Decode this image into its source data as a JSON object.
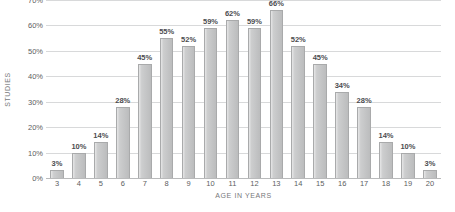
{
  "chart_data": {
    "type": "bar",
    "title": "",
    "xlabel": "AGE IN YEARS",
    "ylabel": "STUDIES",
    "categories": [
      "3",
      "4",
      "5",
      "6",
      "7",
      "8",
      "9",
      "10",
      "11",
      "12",
      "13",
      "14",
      "15",
      "16",
      "17",
      "18",
      "19",
      "20"
    ],
    "values": [
      3,
      10,
      14,
      28,
      45,
      55,
      52,
      59,
      62,
      59,
      66,
      52,
      45,
      34,
      28,
      14,
      10,
      3
    ],
    "value_labels": [
      "3%",
      "10%",
      "14%",
      "28%",
      "45%",
      "55%",
      "52%",
      "59%",
      "62%",
      "59%",
      "66%",
      "52%",
      "45%",
      "34%",
      "28%",
      "14%",
      "10%",
      "3%"
    ],
    "ylim": [
      0,
      70
    ],
    "ytick_values": [
      0,
      10,
      20,
      30,
      40,
      50,
      60,
      70
    ],
    "ytick_labels": [
      "0%",
      "10%",
      "20%",
      "30%",
      "40%",
      "50%",
      "60%",
      "70%"
    ],
    "grid": true,
    "legend": false,
    "legend_position": "none",
    "colors": {
      "bar_fill": "#c7c8c9",
      "bar_border": "#a9aaab",
      "gridline": "#d8d9da",
      "axis_line": "#b9babb",
      "tick_text": "#5d5e61",
      "axis_title_text": "#77787b",
      "value_label_text": "#4c4d50",
      "background": "#ffffff"
    }
  }
}
